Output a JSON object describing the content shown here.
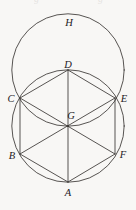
{
  "figure": {
    "kind": "geometry-diagram",
    "width": 136,
    "height": 210,
    "background_color": "#f8f7f5",
    "stroke_color": "#3a3634",
    "label_color": "#24201e"
  },
  "labels": [
    {
      "id": "H",
      "text": "H",
      "x": 69,
      "y": 23
    },
    {
      "id": "D",
      "text": "D",
      "x": 68,
      "y": 65
    },
    {
      "id": "C",
      "text": "C",
      "x": 11,
      "y": 99
    },
    {
      "id": "E",
      "text": "E",
      "x": 124,
      "y": 99
    },
    {
      "id": "G",
      "text": "G",
      "x": 71,
      "y": 116
    },
    {
      "id": "B",
      "text": "B",
      "x": 12,
      "y": 156
    },
    {
      "id": "F",
      "text": "F",
      "x": 123,
      "y": 155
    },
    {
      "id": "A",
      "text": "A",
      "x": 68,
      "y": 193
    }
  ],
  "points": {
    "A": {
      "x": 68,
      "y": 182
    },
    "B": {
      "x": 20,
      "y": 154
    },
    "C": {
      "x": 20,
      "y": 98
    },
    "D": {
      "x": 68,
      "y": 70
    },
    "E": {
      "x": 115,
      "y": 98
    },
    "F": {
      "x": 115,
      "y": 154
    },
    "G": {
      "x": 68,
      "y": 126
    },
    "H": {
      "x": 68,
      "y": 14
    }
  },
  "circles": [
    {
      "id": "lower-circle",
      "cx": 68,
      "cy": 126,
      "r": 56.2
    },
    {
      "id": "upper-circle",
      "cx": 68,
      "cy": 70,
      "r": 56.2
    }
  ],
  "segments": [
    {
      "id": "AB",
      "from": "A",
      "to": "B"
    },
    {
      "id": "BC",
      "from": "B",
      "to": "C"
    },
    {
      "id": "CD",
      "from": "C",
      "to": "D"
    },
    {
      "id": "DE",
      "from": "D",
      "to": "E"
    },
    {
      "id": "EF",
      "from": "E",
      "to": "F"
    },
    {
      "id": "FA",
      "from": "F",
      "to": "A"
    },
    {
      "id": "AD",
      "from": "A",
      "to": "D"
    },
    {
      "id": "BE",
      "from": "B",
      "to": "E"
    },
    {
      "id": "CF",
      "from": "C",
      "to": "F"
    }
  ],
  "ghost_text_row": [
    {
      "text": "g",
      "x": 34
    },
    {
      "text": "g",
      "x": 98
    }
  ]
}
